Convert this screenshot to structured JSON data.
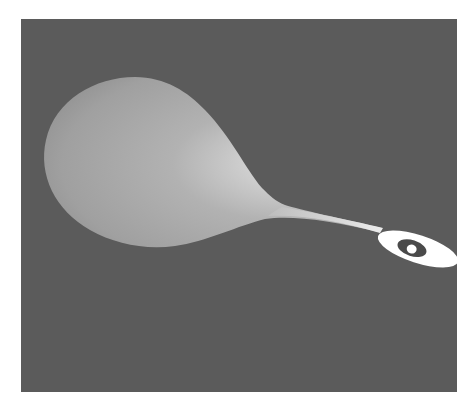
{
  "figure": {
    "colors": {
      "page_background": "#ffffff",
      "panel_background": "#5b5b5b",
      "surface_base": "#a8a8a8",
      "surface_highlight": "#f2f2f2",
      "surface_shadow": "#8e8e8e",
      "ring": "#ffffff",
      "ring_hole": "#4a4a4a"
    }
  }
}
